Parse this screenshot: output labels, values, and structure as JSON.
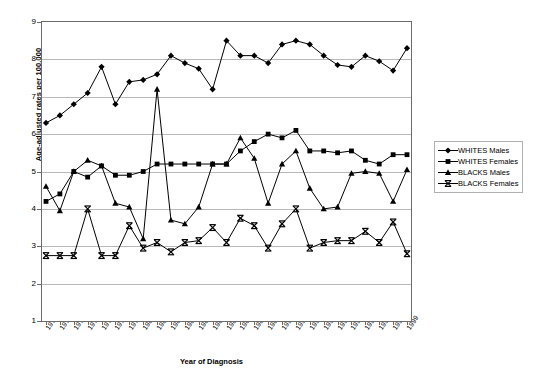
{
  "chart": {
    "ylabel": "Age-adjusted rates per 100,000",
    "xlabel": "Year of Diagnosis"
  },
  "legend": {
    "items": [
      {
        "label": "WHITES Males",
        "marker": "diamond"
      },
      {
        "label": "WHITES Females",
        "marker": "square"
      },
      {
        "label": "BLACKS Males",
        "marker": "triangle"
      },
      {
        "label": "BLACKS Females",
        "marker": "x"
      }
    ]
  },
  "chart_data": {
    "type": "line",
    "title": "",
    "xlabel": "Year of Diagnosis",
    "ylabel": "Age-adjusted rates per 100,000",
    "ylim": [
      1,
      9
    ],
    "yticks": [
      1,
      2,
      3,
      4,
      5,
      6,
      7,
      8,
      9
    ],
    "grid": true,
    "legend_position": "right",
    "categories": [
      "1973",
      "1974",
      "1975",
      "1976",
      "1977",
      "1978",
      "1979",
      "1980",
      "1981",
      "1982",
      "1983",
      "1984",
      "1985",
      "1986",
      "1987",
      "1988",
      "1989",
      "1990",
      "1991",
      "1992",
      "1993",
      "1994",
      "1995",
      "1996",
      "1997",
      "1998",
      "1999"
    ],
    "series": [
      {
        "name": "WHITES Males",
        "marker": "diamond",
        "values": [
          6.3,
          6.5,
          6.8,
          7.1,
          7.8,
          6.8,
          7.4,
          7.45,
          7.6,
          8.1,
          7.9,
          7.75,
          7.2,
          8.5,
          8.1,
          8.1,
          7.9,
          8.4,
          8.5,
          8.4,
          8.1,
          7.85,
          7.8,
          8.1,
          7.95,
          7.7,
          8.3
        ]
      },
      {
        "name": "WHITES Females",
        "marker": "square",
        "values": [
          4.2,
          4.4,
          5.0,
          4.85,
          5.15,
          4.9,
          4.9,
          5.0,
          5.2,
          5.2,
          5.2,
          5.2,
          5.2,
          5.2,
          5.55,
          5.8,
          6.0,
          5.9,
          6.1,
          5.55,
          5.55,
          5.5,
          5.55,
          5.3,
          5.2,
          5.45,
          5.45
        ]
      },
      {
        "name": "BLACKS Males",
        "marker": "triangle",
        "values": [
          4.6,
          3.95,
          5.0,
          5.3,
          5.15,
          4.15,
          4.05,
          3.2,
          7.2,
          3.7,
          3.6,
          4.05,
          5.2,
          5.2,
          5.9,
          5.35,
          4.15,
          5.2,
          5.55,
          4.55,
          4.0,
          4.05,
          4.95,
          5.0,
          4.95,
          4.2,
          5.05
        ]
      },
      {
        "name": "BLACKS Females",
        "marker": "x",
        "values": [
          2.75,
          2.75,
          2.75,
          4.0,
          2.75,
          2.75,
          3.55,
          2.95,
          3.1,
          2.85,
          3.1,
          3.15,
          3.5,
          3.1,
          3.75,
          3.55,
          2.95,
          3.6,
          4.0,
          2.95,
          3.1,
          3.15,
          3.15,
          3.4,
          3.1,
          3.65,
          2.8
        ]
      }
    ]
  }
}
